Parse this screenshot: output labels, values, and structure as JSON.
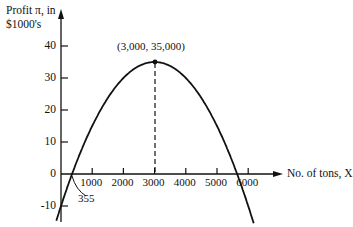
{
  "chart_data": {
    "type": "line",
    "title": "",
    "ylabel": "Profit π, in $1000's",
    "ylabel_lines": [
      "Profit π, in",
      "$1000's"
    ],
    "xlabel": "No. of tons, X",
    "x_ticks": [
      1000,
      2000,
      3000,
      4000,
      5000,
      6000
    ],
    "x_tick_labels": [
      "1000",
      "2000",
      "3000",
      "4000",
      "5000",
      "6000"
    ],
    "y_ticks": [
      -10,
      0,
      10,
      20,
      30,
      40
    ],
    "y_tick_labels": [
      "-10",
      "0",
      "10",
      "20",
      "30",
      "40"
    ],
    "xlim": [
      0,
      6600
    ],
    "ylim": [
      -14,
      48
    ],
    "grid": false,
    "series": [
      {
        "name": "Profit π",
        "equation": "π = 35000 − 0.005(X − 3000)²",
        "x": [
          0,
          355,
          1000,
          1500,
          2000,
          2500,
          3000,
          3500,
          4000,
          4500,
          5000,
          5500,
          5645,
          6000
        ],
        "y": [
          -10,
          0,
          15,
          23.75,
          30,
          33.75,
          35,
          33.75,
          30,
          23.75,
          15,
          3.75,
          0,
          -10
        ]
      }
    ],
    "annotations": [
      {
        "text": "(3,000, 35,000)",
        "x": 3000,
        "y": 35,
        "type": "maximum-point",
        "dashed_drop_line": true
      },
      {
        "text": "355",
        "x": 355,
        "y": 0,
        "type": "x-intercept-callout"
      }
    ]
  },
  "labels": {
    "y_axis_line1": "Profit π, in",
    "y_axis_line2": "$1000's",
    "x_axis": "No. of tons, X",
    "peak": "(3,000, 35,000)",
    "intercept": "355"
  },
  "colors": {
    "ink": "#111111",
    "background": "#ffffff"
  }
}
